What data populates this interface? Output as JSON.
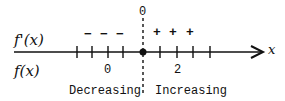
{
  "diagram": {
    "type": "sign-chart",
    "row_labels": {
      "derivative": "f'(x)",
      "function": "f(x)"
    },
    "axis_label": "x",
    "critical_point": {
      "value": "0",
      "label": "0"
    },
    "tick_labels": {
      "left": "0",
      "right": "2"
    },
    "signs": {
      "left": [
        "−",
        "−",
        "−"
      ],
      "right": [
        "+",
        "+",
        "+"
      ]
    },
    "regions": {
      "left": "Decreasing",
      "right": "Increasing"
    }
  }
}
